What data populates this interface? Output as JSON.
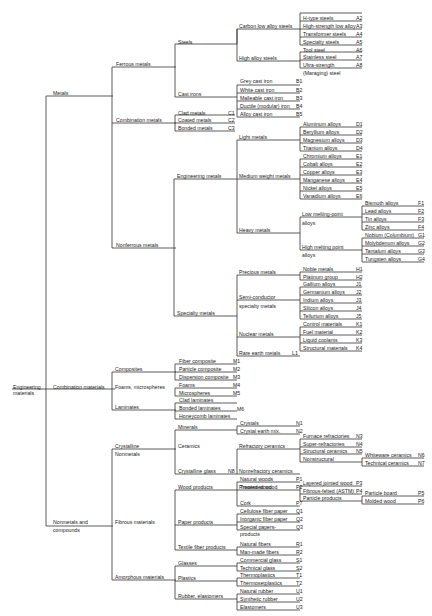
{
  "diagram": {
    "root": "Engineering materials",
    "nodes": [
      {
        "id": "root1",
        "text": "Engineering",
        "x": 13,
        "y": 384
      },
      {
        "id": "root2",
        "text": "materials",
        "x": 13,
        "y": 390
      },
      {
        "id": "metals",
        "text": "Metals",
        "x": 53,
        "y": 90
      },
      {
        "id": "combmat",
        "text": "Combination materials",
        "x": 53,
        "y": 384
      },
      {
        "id": "nonmet1",
        "text": "Nonmetals and",
        "x": 53,
        "y": 519
      },
      {
        "id": "nonmet2",
        "text": "compounds",
        "x": 53,
        "y": 527
      },
      {
        "id": "ferrous",
        "text": "Ferrous metals",
        "x": 116,
        "y": 61
      },
      {
        "id": "combmet",
        "text": "Combination metals",
        "x": 116,
        "y": 117
      },
      {
        "id": "nonferrous",
        "text": "Nonferrous metals",
        "x": 116,
        "y": 242
      },
      {
        "id": "composites",
        "text": "Composites",
        "x": 115,
        "y": 366
      },
      {
        "id": "foams",
        "text": "Foams, microspheres",
        "x": 115,
        "y": 384
      },
      {
        "id": "laminates",
        "text": "Laminates",
        "x": 115,
        "y": 404
      },
      {
        "id": "crystalline",
        "text": "Crystalline",
        "x": 115,
        "y": 443
      },
      {
        "id": "nonmetals2",
        "text": "Nonmetals",
        "x": 115,
        "y": 451
      },
      {
        "id": "fibrous",
        "text": "Fibrous materials",
        "x": 115,
        "y": 519
      },
      {
        "id": "amorphous",
        "text": "Amorphous materials",
        "x": 115,
        "y": 574
      },
      {
        "id": "steels",
        "text": "Steels",
        "x": 178,
        "y": 39
      },
      {
        "id": "castirons",
        "text": "Cast irons",
        "x": 178,
        "y": 91
      },
      {
        "id": "engmetals",
        "text": "Engineering metals",
        "x": 177,
        "y": 173
      },
      {
        "id": "specmetals",
        "text": "Specialty metals",
        "x": 177,
        "y": 310
      },
      {
        "id": "minerals",
        "text": "Minerals",
        "x": 178,
        "y": 424
      },
      {
        "id": "ceramics",
        "text": "Ceramics",
        "x": 178,
        "y": 443
      },
      {
        "id": "crysglass",
        "text": "Crystalline glass",
        "x": 178,
        "y": 468
      },
      {
        "id": "wood",
        "text": "Wood products",
        "x": 178,
        "y": 484
      },
      {
        "id": "paper",
        "text": "Paper products",
        "x": 178,
        "y": 519
      },
      {
        "id": "textile",
        "text": "Textile fiber products",
        "x": 178,
        "y": 544
      },
      {
        "id": "glasses",
        "text": "Glasses",
        "x": 178,
        "y": 560
      },
      {
        "id": "plastics",
        "text": "Plastics",
        "x": 178,
        "y": 575
      },
      {
        "id": "rubber",
        "text": "Rubber, elastomers",
        "x": 178,
        "y": 593
      },
      {
        "id": "carbonlow",
        "text": "Carbon low alloy steels",
        "x": 239,
        "y": 23
      },
      {
        "id": "highalloy",
        "text": "High alloy steels",
        "x": 239,
        "y": 55
      },
      {
        "id": "clad",
        "text": "Clad metals",
        "x": 178,
        "y": 110
      },
      {
        "id": "coated",
        "text": "Coated metals",
        "x": 178,
        "y": 117
      },
      {
        "id": "bonded",
        "text": "Bonded metals",
        "x": 178,
        "y": 125
      },
      {
        "id": "light",
        "text": "Light metals",
        "x": 239,
        "y": 134
      },
      {
        "id": "medium",
        "text": "Medium weight metals",
        "x": 239,
        "y": 173
      },
      {
        "id": "heavy",
        "text": "Heavy metals",
        "x": 239,
        "y": 227
      },
      {
        "id": "precious",
        "text": "Precious metals",
        "x": 239,
        "y": 269
      },
      {
        "id": "semi1",
        "text": "Semi-conductor",
        "x": 239,
        "y": 294
      },
      {
        "id": "semi2",
        "text": "specialty metals",
        "x": 239,
        "y": 303
      },
      {
        "id": "nuclear",
        "text": "Nuclear metals",
        "x": 239,
        "y": 331
      },
      {
        "id": "rareearth",
        "text": "Rare earth metals",
        "x": 239,
        "y": 350
      },
      {
        "id": "refcer",
        "text": "Refractory ceramics",
        "x": 239,
        "y": 443
      },
      {
        "id": "nonrefcer",
        "text": "Nonrefractory ceramics",
        "x": 239,
        "y": 468
      },
      {
        "id": "processed",
        "text": "Processed wood",
        "x": 239,
        "y": 484
      },
      {
        "id": "lowmelt1",
        "text": "Low melting-point",
        "x": 302,
        "y": 211
      },
      {
        "id": "lowmelt2",
        "text": "alloys",
        "x": 302,
        "y": 220
      },
      {
        "id": "highmelt1",
        "text": "High melting point",
        "x": 302,
        "y": 244
      },
      {
        "id": "highmelt2",
        "text": "alloys",
        "x": 302,
        "y": 252
      }
    ],
    "leaves": [
      {
        "text": "H-type steels",
        "code": "A2",
        "x": 302,
        "y": 15
      },
      {
        "text": "High-strength low alloy",
        "code": "A3",
        "x": 302,
        "y": 23
      },
      {
        "text": "Transformer steels",
        "code": "A4",
        "x": 302,
        "y": 31
      },
      {
        "text": "Specialty steels",
        "code": "A5",
        "x": 302,
        "y": 39
      },
      {
        "text": "Tool steel",
        "code": "A6",
        "x": 302,
        "y": 47
      },
      {
        "text": "Stainless steel",
        "code": "A7",
        "x": 302,
        "y": 54
      },
      {
        "text": "Ultra-strength",
        "code": "A8",
        "x": 302,
        "y": 62
      },
      {
        "text": "(Maraging) steel",
        "code": "",
        "x": 302,
        "y": 70
      },
      {
        "text": "Grey cast iron",
        "code": "B1",
        "x": 239,
        "y": 78
      },
      {
        "text": "White cast iron",
        "code": "B2",
        "x": 239,
        "y": 87
      },
      {
        "text": "Malleable cast iron",
        "code": "B3",
        "x": 239,
        "y": 95
      },
      {
        "text": "Ductile (modular) iron",
        "code": "B4",
        "x": 239,
        "y": 103
      },
      {
        "text": "Alloy cast iron",
        "code": "B5",
        "x": 239,
        "y": 111
      },
      {
        "text": "Aluminum alloys",
        "code": "D1",
        "x": 302,
        "y": 121
      },
      {
        "text": "Beryllium alloys",
        "code": "D2",
        "x": 302,
        "y": 129
      },
      {
        "text": "Magnesium alloys",
        "code": "D3",
        "x": 302,
        "y": 137
      },
      {
        "text": "Titanium alloys",
        "code": "D4",
        "x": 302,
        "y": 145
      },
      {
        "text": "Chromium alloys",
        "code": "E1",
        "x": 302,
        "y": 153
      },
      {
        "text": "Cobalt alloys",
        "code": "E2",
        "x": 302,
        "y": 161
      },
      {
        "text": "Copper alloys",
        "code": "E3",
        "x": 302,
        "y": 169
      },
      {
        "text": "Manganese alloys",
        "code": "E4",
        "x": 302,
        "y": 177
      },
      {
        "text": "Nickel alloys",
        "code": "E5",
        "x": 302,
        "y": 185
      },
      {
        "text": "Vanadium alloys",
        "code": "E6",
        "x": 302,
        "y": 193
      },
      {
        "text": "Bismuth alloys",
        "code": "F1",
        "x": 364,
        "y": 200
      },
      {
        "text": "Lead alloys",
        "code": "F2",
        "x": 364,
        "y": 208
      },
      {
        "text": "Tin alloys",
        "code": "F3",
        "x": 364,
        "y": 216
      },
      {
        "text": "Zinc alloys",
        "code": "F4",
        "x": 364,
        "y": 224
      },
      {
        "text": "Nobium (Columbium)",
        "code": "G1",
        "x": 364,
        "y": 232
      },
      {
        "text": "Molybdenum alloys",
        "code": "G2",
        "x": 364,
        "y": 240
      },
      {
        "text": "Tantalum alloys",
        "code": "G3",
        "x": 364,
        "y": 248
      },
      {
        "text": "Tungsten alloys",
        "code": "G4",
        "x": 364,
        "y": 256
      },
      {
        "text": "Noble metals",
        "code": "H1",
        "x": 302,
        "y": 266
      },
      {
        "text": "Platinum group",
        "code": "H2",
        "x": 302,
        "y": 274
      },
      {
        "text": "Gallium alloys",
        "code": "J1",
        "x": 302,
        "y": 281
      },
      {
        "text": "Germanium alloys",
        "code": "J2",
        "x": 302,
        "y": 289
      },
      {
        "text": "Indium alloys",
        "code": "J3",
        "x": 302,
        "y": 297
      },
      {
        "text": "Silicon alloys",
        "code": "J4",
        "x": 302,
        "y": 305
      },
      {
        "text": "Tellurium alloys",
        "code": "J5",
        "x": 302,
        "y": 313
      },
      {
        "text": "Control materials",
        "code": "K1",
        "x": 302,
        "y": 321
      },
      {
        "text": "Fuel material",
        "code": "K2",
        "x": 302,
        "y": 329
      },
      {
        "text": "Liquid coolants",
        "code": "K3",
        "x": 302,
        "y": 337
      },
      {
        "text": "Structural materials",
        "code": "K4",
        "x": 302,
        "y": 345
      },
      {
        "text": "Fiber composite",
        "code": "M1",
        "x": 178,
        "y": 358
      },
      {
        "text": "Particle composite",
        "code": "M2",
        "x": 178,
        "y": 366
      },
      {
        "text": "Dispersion composite",
        "code": "M3",
        "x": 178,
        "y": 374
      },
      {
        "text": "Foams",
        "code": "M4",
        "x": 178,
        "y": 382
      },
      {
        "text": "Microspheres",
        "code": "M5",
        "x": 178,
        "y": 390
      },
      {
        "text": "Clad laminates",
        "code": "",
        "x": 178,
        "y": 397
      },
      {
        "text": "Bonded laminates",
        "code": "",
        "x": 178,
        "y": 405
      },
      {
        "text": "Honeycomb laminates",
        "code": "",
        "x": 178,
        "y": 413
      },
      {
        "text": "Crystals",
        "code": "N1",
        "x": 239,
        "y": 420
      },
      {
        "text": "Crystal earth mix.",
        "code": "N2",
        "x": 239,
        "y": 428
      },
      {
        "text": "Furnace refractories",
        "code": "N3",
        "x": 302,
        "y": 433
      },
      {
        "text": "Super-refractories",
        "code": "N4",
        "x": 302,
        "y": 441
      },
      {
        "text": "Structural ceramics",
        "code": "N5",
        "x": 302,
        "y": 448
      },
      {
        "text": "Nonstructural",
        "code": "",
        "x": 302,
        "y": 456
      },
      {
        "text": "Whiteware ceramics",
        "code": "N6",
        "x": 364,
        "y": 452
      },
      {
        "text": "Technical ceramics",
        "code": "N7",
        "x": 364,
        "y": 460
      },
      {
        "text": "Natural woods",
        "code": "P1",
        "x": 239,
        "y": 476
      },
      {
        "text": "Treated wood",
        "code": "P2",
        "x": 239,
        "y": 484
      },
      {
        "text": "Cork",
        "code": "P7",
        "x": 239,
        "y": 500
      },
      {
        "text": "Layered jointed wood",
        "code": "P3",
        "x": 302,
        "y": 480
      },
      {
        "text": "Fibrous-felted (ASTM)",
        "code": "P4",
        "x": 302,
        "y": 488
      },
      {
        "text": "Particle products",
        "code": "",
        "x": 302,
        "y": 495
      },
      {
        "text": "Particle board",
        "code": "P5",
        "x": 364,
        "y": 490
      },
      {
        "text": "Molded wood",
        "code": "P6",
        "x": 364,
        "y": 498
      },
      {
        "text": "Cellulose fiber paper",
        "code": "Q1",
        "x": 239,
        "y": 508
      },
      {
        "text": "Inorganic fiber paper",
        "code": "Q2",
        "x": 239,
        "y": 516
      },
      {
        "text": "Special papers-",
        "code": "Q3",
        "x": 239,
        "y": 524
      },
      {
        "text": "products",
        "code": "",
        "x": 239,
        "y": 531
      },
      {
        "text": "Natural fibers",
        "code": "R1",
        "x": 239,
        "y": 541
      },
      {
        "text": "Man-made fibers",
        "code": "R2",
        "x": 239,
        "y": 549
      },
      {
        "text": "Commercial glass",
        "code": "S1",
        "x": 239,
        "y": 557
      },
      {
        "text": "Technical glass",
        "code": "S2",
        "x": 239,
        "y": 565
      },
      {
        "text": "Thermoplastics",
        "code": "T1",
        "x": 239,
        "y": 572
      },
      {
        "text": "Thermosetplastics",
        "code": "T2",
        "x": 239,
        "y": 580
      },
      {
        "text": "Natural rubber",
        "code": "U1",
        "x": 239,
        "y": 588
      },
      {
        "text": "Synthetic rubber",
        "code": "U2",
        "x": 239,
        "y": 596
      },
      {
        "text": "Elastomers",
        "code": "U3",
        "x": 239,
        "y": 604
      }
    ],
    "side_codes": [
      {
        "text": "C1",
        "x": 228,
        "y": 110
      },
      {
        "text": "C2",
        "x": 228,
        "y": 117
      },
      {
        "text": "C3",
        "x": 228,
        "y": 125
      },
      {
        "text": "L1",
        "x": 292,
        "y": 350
      },
      {
        "text": "M6",
        "x": 237,
        "y": 406
      },
      {
        "text": "N8",
        "x": 228,
        "y": 468
      }
    ]
  }
}
